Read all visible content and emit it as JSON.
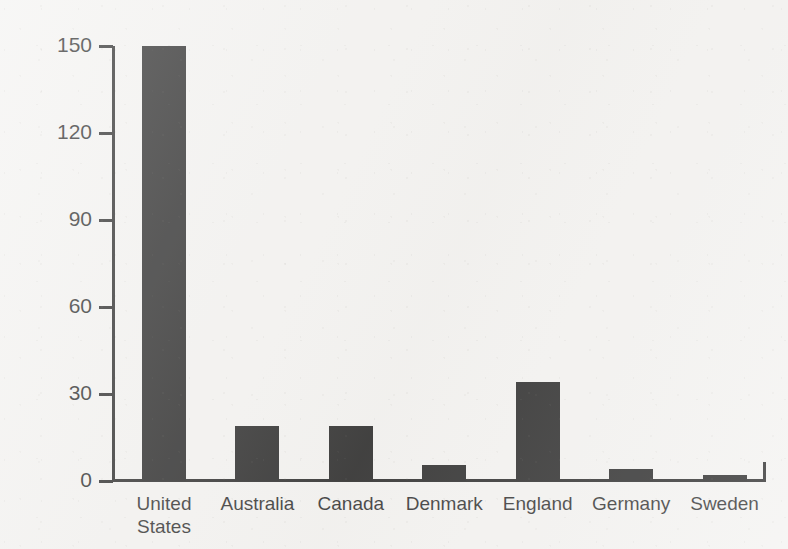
{
  "chart_data": {
    "type": "bar",
    "title": "",
    "xlabel": "",
    "ylabel": "Gonorrhea Rates (per 100,000 persons)",
    "categories": [
      "United\nStates",
      "Australia",
      "Canada",
      "Denmark",
      "England",
      "Germany",
      "Sweden"
    ],
    "category_names": [
      "United States",
      "Australia",
      "Canada",
      "Denmark",
      "England",
      "Germany",
      "Sweden"
    ],
    "values": [
      150,
      19,
      19,
      5.5,
      34,
      4,
      2
    ],
    "ylim": [
      0,
      150
    ],
    "yticks": [
      0,
      30,
      60,
      90,
      120,
      150
    ],
    "ytick_labels": [
      "0",
      "30",
      "60",
      "90",
      "120",
      "150"
    ],
    "grid": false,
    "legend": null,
    "bar_color": "#111111",
    "axis_color": "#141414",
    "background_color": "#f3f2f0"
  }
}
